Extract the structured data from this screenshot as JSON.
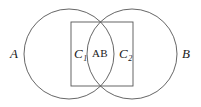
{
  "figure": {
    "type": "venn-diagram",
    "stroke_color": "#555555",
    "background_color": "#ffffff",
    "labels": {
      "left_circle": "A",
      "right_circle": "B",
      "left_region": "C",
      "left_region_subscript": "1",
      "intersection": "AB",
      "right_region": "C",
      "right_region_subscript": "2"
    },
    "geometry": {
      "left_circle": {
        "cx": 69,
        "cy": 54,
        "r": 45
      },
      "right_circle": {
        "cx": 132,
        "cy": 54,
        "r": 45
      },
      "rectangle": {
        "x": 71,
        "y": 22,
        "width": 62,
        "height": 64
      }
    }
  }
}
